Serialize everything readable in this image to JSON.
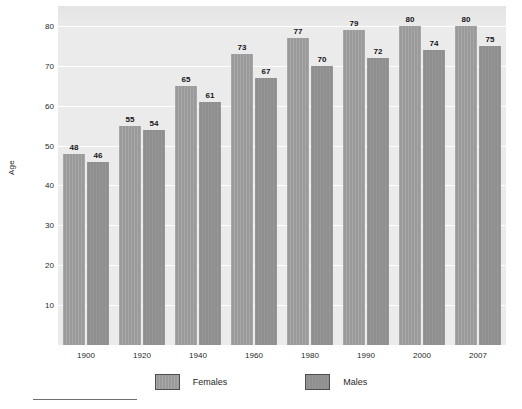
{
  "chart_data": {
    "type": "bar",
    "title": "",
    "subtitle": "",
    "xlabel": "",
    "ylabel": "Age",
    "categories": [
      "1900",
      "1920",
      "1940",
      "1960",
      "1980",
      "1990",
      "2000",
      "2007"
    ],
    "series": [
      {
        "name": "Females",
        "values": [
          48,
          55,
          65,
          73,
          77,
          79,
          80,
          80
        ],
        "color": "#9a9a9a"
      },
      {
        "name": "Males",
        "values": [
          46,
          54,
          61,
          67,
          70,
          72,
          74,
          75
        ],
        "color": "#8f8f8f"
      }
    ],
    "ylim": [
      0,
      85
    ],
    "yticks": [
      10,
      20,
      30,
      40,
      50,
      60,
      70,
      80
    ],
    "ytick_labels": [
      "10",
      "20",
      "30",
      "40",
      "50",
      "60",
      "70",
      "80"
    ],
    "grid": true,
    "grid_color": "#ffffff",
    "plot_background": "#ebebeb",
    "legend_position": "bottom",
    "data_labels": true
  },
  "axes": {
    "y_title": "Age"
  },
  "legend": {
    "items": [
      {
        "label": "Females"
      },
      {
        "label": "Males"
      }
    ]
  }
}
